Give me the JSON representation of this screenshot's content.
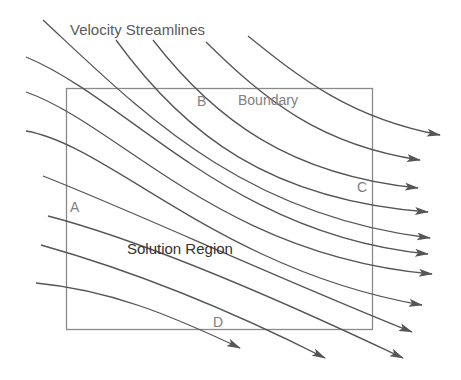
{
  "diagram": {
    "title": "Velocity Streamlines",
    "region_label": "Solution Region",
    "boundary_label": "Boundary",
    "corner_labels": {
      "a": "A",
      "b": "B",
      "c": "C",
      "d": "D"
    },
    "colors": {
      "streamline": "#555555",
      "boundary": "#8a8a8a",
      "label_gray": "#808080",
      "label_dark": "#333333"
    }
  }
}
